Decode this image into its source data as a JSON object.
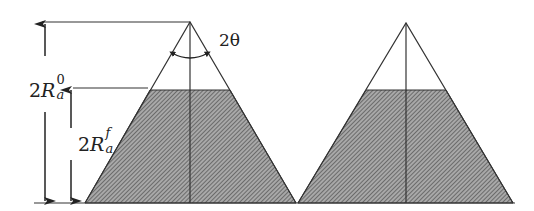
{
  "diagram": {
    "labels": {
      "angle": "2θ",
      "initial_height": {
        "prefix": "2",
        "symbol": "R",
        "sub": "a",
        "sup": "0"
      },
      "final_height": {
        "prefix": "2",
        "symbol": "R",
        "sub": "a",
        "sup": "f"
      }
    },
    "colors": {
      "line": "#333333",
      "hatch_fill": "#9a9a9a",
      "hatch_line": "#555555",
      "background": "#ffffff"
    },
    "cones": [
      {
        "name": "left-cone",
        "apex": [
          190,
          22
        ],
        "base_left": [
          85,
          203
        ],
        "base_right": [
          296,
          203
        ],
        "fill_top_y": 90
      },
      {
        "name": "right-cone",
        "apex": [
          406,
          23
        ],
        "base_left": [
          298,
          203
        ],
        "base_right": [
          513,
          203
        ],
        "fill_top_y": 90
      }
    ]
  }
}
